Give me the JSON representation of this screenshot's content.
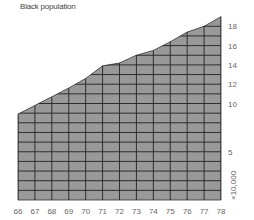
{
  "chart_data": {
    "type": "area",
    "title": "Black population",
    "xlabel": "",
    "ylabel": "",
    "unit_label": "×10,000",
    "categories": [
      "66",
      "67",
      "68",
      "69",
      "70",
      "71",
      "72",
      "73",
      "74",
      "75",
      "76",
      "77",
      "78"
    ],
    "values": [
      8.9,
      9.8,
      10.7,
      11.6,
      12.6,
      13.9,
      14.2,
      15.0,
      15.5,
      16.4,
      17.4,
      18.0,
      19.0
    ],
    "yticks": [
      5,
      10,
      12,
      14,
      16,
      18
    ],
    "ylim": [
      0,
      19.5
    ],
    "grid": true,
    "legend": null,
    "fill_color": "#999999",
    "grid_color": "#222222"
  }
}
